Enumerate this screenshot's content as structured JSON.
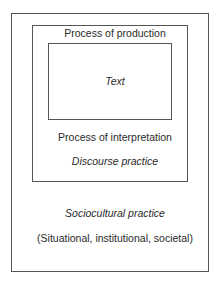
{
  "diagram": {
    "outer": {
      "title": "Sociocultural practice",
      "subtitle": "(Situational, institutional, societal)"
    },
    "middle": {
      "top_label": "Process of production",
      "bottom_label": "Process of interpretation",
      "title": "Discourse practice"
    },
    "inner": {
      "title": "Text"
    }
  }
}
